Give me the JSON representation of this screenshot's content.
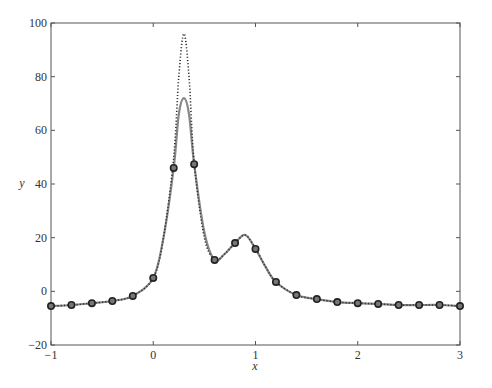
{
  "chart_data": {
    "type": "line",
    "title": "",
    "xlabel": "x",
    "ylabel": "y",
    "xlim": [
      -1,
      3
    ],
    "ylim": [
      -20,
      100
    ],
    "xticks": [
      -1,
      0,
      1,
      2,
      3
    ],
    "yticks": [
      -20,
      0,
      20,
      40,
      60,
      80,
      100
    ],
    "grid": false,
    "legend": null,
    "series": [
      {
        "name": "exact function",
        "style": "dotted",
        "color": "#333333",
        "x": [
          -1,
          -0.8,
          -0.6,
          -0.4,
          -0.2,
          0,
          0.1,
          0.2,
          0.25,
          0.3,
          0.35,
          0.4,
          0.5,
          0.6,
          0.7,
          0.8,
          0.9,
          1.0,
          1.1,
          1.2,
          1.4,
          1.6,
          1.8,
          2.0,
          2.2,
          2.4,
          2.6,
          2.8,
          3.0
        ],
        "y": [
          -5.5,
          -5.1,
          -4.4,
          -3.6,
          -1.7,
          5.0,
          20,
          50,
          80,
          96,
          80,
          48,
          20,
          12,
          14,
          18,
          21,
          16,
          9,
          3.5,
          -1.4,
          -2.9,
          -4.0,
          -4.4,
          -4.7,
          -5.1,
          -5.1,
          -5.1,
          -5.5
        ]
      },
      {
        "name": "interpolant",
        "style": "solid",
        "color": "#888888",
        "x": [
          -1,
          -0.8,
          -0.6,
          -0.4,
          -0.2,
          0,
          0.1,
          0.2,
          0.25,
          0.3,
          0.35,
          0.4,
          0.5,
          0.6,
          0.7,
          0.8,
          0.9,
          1.0,
          1.1,
          1.2,
          1.4,
          1.6,
          1.8,
          2.0,
          2.2,
          2.4,
          2.6,
          2.8,
          3.0
        ],
        "y": [
          -5.5,
          -5.1,
          -4.4,
          -3.6,
          -1.7,
          5.0,
          20,
          46,
          66,
          72,
          66,
          47.4,
          22,
          11.7,
          14,
          18,
          21,
          15.8,
          9,
          3.5,
          -1.4,
          -2.9,
          -4.0,
          -4.4,
          -4.7,
          -5.1,
          -5.1,
          -5.1,
          -5.5
        ]
      },
      {
        "name": "interpolation nodes",
        "style": "markers",
        "marker": "circle",
        "color": "#222222",
        "x": [
          -1,
          -0.8,
          -0.6,
          -0.4,
          -0.2,
          0,
          0.2,
          0.4,
          0.6,
          0.8,
          1.0,
          1.2,
          1.4,
          1.6,
          1.8,
          2.0,
          2.2,
          2.4,
          2.6,
          2.8,
          3.0
        ],
        "y": [
          -5.5,
          -5.1,
          -4.4,
          -3.6,
          -1.7,
          5.0,
          46.0,
          47.4,
          11.7,
          18.0,
          15.8,
          3.5,
          -1.4,
          -2.9,
          -4.0,
          -4.4,
          -4.7,
          -5.1,
          -5.1,
          -5.1,
          -5.5
        ]
      }
    ]
  },
  "axes": {
    "xlabel": "x",
    "ylabel": "y",
    "xtick_labels": [
      "−1",
      "0",
      "1",
      "2",
      "3"
    ],
    "ytick_labels": [
      "−20",
      "0",
      "20",
      "40",
      "60",
      "80",
      "100"
    ]
  }
}
